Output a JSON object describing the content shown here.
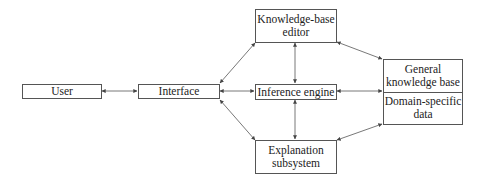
{
  "diagram": {
    "type": "block-diagram",
    "nodes": {
      "user": {
        "label": "User"
      },
      "interface": {
        "label": "Interface"
      },
      "kb_editor": {
        "line1": "Knowledge-base",
        "line2": "editor"
      },
      "inference_engine": {
        "label": "Inference engine"
      },
      "explanation": {
        "line1": "Explanation",
        "line2": "subsystem"
      },
      "knowledge_base": {
        "top": {
          "line1": "General",
          "line2": "knowledge base"
        },
        "bottom": {
          "line1": "Domain-specific",
          "line2": "data"
        }
      }
    },
    "edges": [
      {
        "from": "User",
        "to": "Interface",
        "direction": "bidirectional"
      },
      {
        "from": "Interface",
        "to": "Knowledge-base editor",
        "direction": "bidirectional"
      },
      {
        "from": "Interface",
        "to": "Inference engine",
        "direction": "bidirectional"
      },
      {
        "from": "Interface",
        "to": "Explanation subsystem",
        "direction": "bidirectional"
      },
      {
        "from": "Knowledge-base editor",
        "to": "Inference engine",
        "direction": "bidirectional"
      },
      {
        "from": "Inference engine",
        "to": "Explanation subsystem",
        "direction": "bidirectional"
      },
      {
        "from": "Knowledge-base editor",
        "to": "General knowledge base / Domain-specific data",
        "direction": "bidirectional"
      },
      {
        "from": "Inference engine",
        "to": "General knowledge base / Domain-specific data",
        "direction": "bidirectional"
      },
      {
        "from": "Explanation subsystem",
        "to": "General knowledge base / Domain-specific data",
        "direction": "bidirectional"
      }
    ],
    "colors": {
      "line": "#555555",
      "text": "#222222",
      "background": "#ffffff"
    }
  }
}
